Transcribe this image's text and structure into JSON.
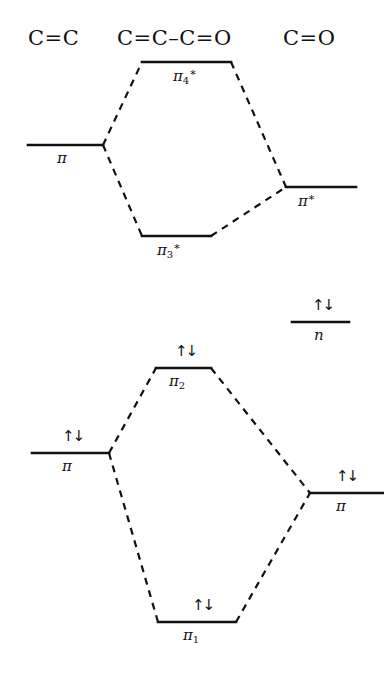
{
  "diagram": {
    "headers": [
      {
        "name": "header-left",
        "text": "C=C",
        "x": 28,
        "y": 26
      },
      {
        "name": "header-center",
        "text": "C=C–C=O",
        "x": 117,
        "y": 26
      },
      {
        "name": "header-right",
        "text": "C=O",
        "x": 283,
        "y": 26
      }
    ],
    "electron_glyph": "↑↓",
    "levels": [
      {
        "id": "pi-ec-antibond-left",
        "label": "π",
        "sub": "",
        "star": false,
        "x1": 28,
        "x2": 103,
        "y": 145,
        "label_x": 57,
        "label_y": 149,
        "electrons": 0,
        "e_x": 0,
        "e_y": 0
      },
      {
        "id": "pi4-star",
        "label": "π",
        "sub": "4",
        "star": true,
        "x1": 142,
        "x2": 231,
        "y": 62,
        "label_x": 173,
        "label_y": 66,
        "electrons": 0,
        "e_x": 0,
        "e_y": 0
      },
      {
        "id": "pi3-star",
        "label": "π",
        "sub": "3",
        "star": true,
        "x1": 142,
        "x2": 211,
        "y": 236,
        "label_x": 157,
        "label_y": 240,
        "electrons": 0,
        "e_x": 0,
        "e_y": 0
      },
      {
        "id": "pi-star-co",
        "label": "π",
        "sub": "",
        "star": true,
        "x1": 286,
        "x2": 356,
        "y": 187,
        "label_x": 298,
        "label_y": 191,
        "electrons": 0,
        "e_x": 0,
        "e_y": 0
      },
      {
        "id": "n-nonbonding",
        "label": "n",
        "sub": "",
        "star": false,
        "x1": 292,
        "x2": 349,
        "y": 322,
        "label_x": 314,
        "label_y": 326,
        "electrons": 2,
        "e_x": 312,
        "e_y": 296
      },
      {
        "id": "pi2-bonding",
        "label": "π",
        "sub": "2",
        "star": false,
        "x1": 156,
        "x2": 211,
        "y": 368,
        "label_x": 169,
        "label_y": 372,
        "electrons": 2,
        "e_x": 175,
        "e_y": 342
      },
      {
        "id": "pi-cc-bonding",
        "label": "π",
        "sub": "",
        "star": false,
        "x1": 32,
        "x2": 109,
        "y": 453,
        "label_x": 62,
        "label_y": 457,
        "electrons": 2,
        "e_x": 62,
        "e_y": 427
      },
      {
        "id": "pi-co-bonding",
        "label": "π",
        "sub": "",
        "star": false,
        "x1": 310,
        "x2": 383,
        "y": 493,
        "label_x": 336,
        "label_y": 497,
        "electrons": 2,
        "e_x": 336,
        "e_y": 467
      },
      {
        "id": "pi1-bonding",
        "label": "π",
        "sub": "1",
        "star": false,
        "x1": 158,
        "x2": 236,
        "y": 622,
        "label_x": 183,
        "label_y": 626,
        "electrons": 2,
        "e_x": 192,
        "e_y": 596
      }
    ],
    "connectors": [
      {
        "name": "connector-cc-to-pi4",
        "x1": 103,
        "y1": 145,
        "x2": 142,
        "y2": 62
      },
      {
        "name": "connector-cc-to-pi3",
        "x1": 103,
        "y1": 145,
        "x2": 142,
        "y2": 236
      },
      {
        "name": "connector-pi4-to-costar",
        "x1": 231,
        "y1": 62,
        "x2": 286,
        "y2": 187
      },
      {
        "name": "connector-pi3-to-costar",
        "x1": 211,
        "y1": 236,
        "x2": 286,
        "y2": 187
      },
      {
        "name": "connector-ccb-to-pi2",
        "x1": 109,
        "y1": 453,
        "x2": 156,
        "y2": 368
      },
      {
        "name": "connector-ccb-to-pi1",
        "x1": 109,
        "y1": 453,
        "x2": 158,
        "y2": 622
      },
      {
        "name": "connector-pi2-to-cob",
        "x1": 211,
        "y1": 368,
        "x2": 310,
        "y2": 493
      },
      {
        "name": "connector-pi1-to-cob",
        "x1": 236,
        "y1": 622,
        "x2": 310,
        "y2": 493
      }
    ],
    "style": {
      "line_color": "#111111",
      "level_stroke": 2.6,
      "connector_stroke": 2.2,
      "dash_pattern": "7,6"
    }
  }
}
